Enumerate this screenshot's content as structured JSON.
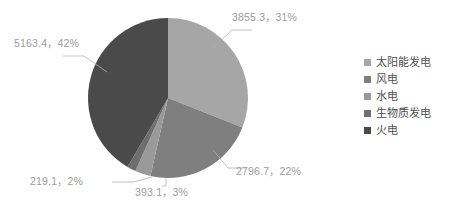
{
  "chart_data": {
    "type": "pie",
    "title": "",
    "subtitle": "",
    "xlabel": "",
    "ylabel": "",
    "legend_position": "right",
    "grid": false,
    "start_angle_deg": 0,
    "direction": "clockwise",
    "categories": [
      "太阳能发电",
      "风电",
      "水电",
      "生物质发电",
      "火电"
    ],
    "values": [
      3855.3,
      2796.7,
      393.1,
      219.1,
      5163.4
    ],
    "percents": [
      31,
      22,
      3,
      2,
      42
    ],
    "colors": [
      "#a6a6a6",
      "#7f7f7f",
      "#9a9a9a",
      "#6e6e6e",
      "#4a4a4a"
    ],
    "data_labels": [
      "3855.3，31%",
      "2796.7，22%",
      "393.1，3%",
      "219.1，2%",
      "5163.4，42%"
    ]
  },
  "labels": {
    "solar": "3855.3，31%",
    "wind": "2796.7，22%",
    "hydro": "393.1，3%",
    "biomass": "219.1，2%",
    "thermal": "5163.4，42%"
  },
  "legend": {
    "items": [
      {
        "label": "太阳能发电",
        "color": "#a6a6a6"
      },
      {
        "label": "风电",
        "color": "#7f7f7f"
      },
      {
        "label": "水电",
        "color": "#9a9a9a"
      },
      {
        "label": "生物质发电",
        "color": "#6e6e6e"
      },
      {
        "label": "火电",
        "color": "#4a4a4a"
      }
    ]
  },
  "style": {
    "label_color": "#9c9c9c",
    "legend_text_color": "#4f4f4f",
    "leader_line_color": "#b0b0b0",
    "background": "#ffffff"
  }
}
